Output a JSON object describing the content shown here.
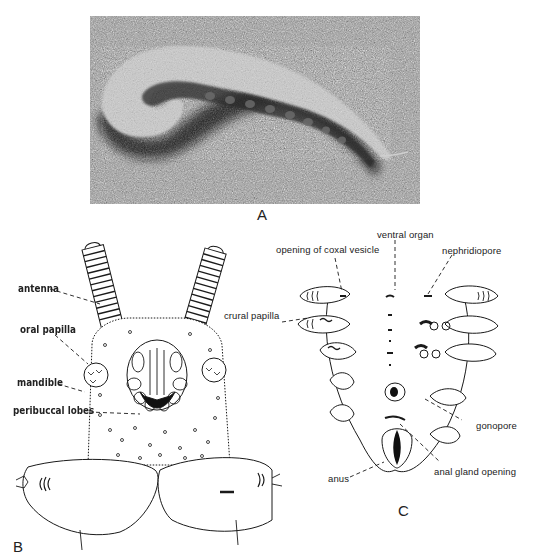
{
  "figure": {
    "top_caption_fragment": "",
    "panels": [
      {
        "id": "A",
        "label": "A",
        "type": "photograph",
        "description": "Onychophoran (velvet worm) curled on a textured substrate"
      },
      {
        "id": "B",
        "label": "B",
        "type": "line-drawing",
        "description": "Ventral view of head region",
        "annotations": [
          {
            "text": "antenna"
          },
          {
            "text": "oral papilla"
          },
          {
            "text": "mandible"
          },
          {
            "text": "peribuccal lobes"
          }
        ]
      },
      {
        "id": "C",
        "label": "C",
        "type": "line-drawing",
        "description": "Ventral view of posterior body region",
        "annotations": [
          {
            "text": "opening of coxal vesicle"
          },
          {
            "text": "ventral organ"
          },
          {
            "text": "nephridiopore"
          },
          {
            "text": "crural papilla"
          },
          {
            "text": "gonopore"
          },
          {
            "text": "anal gland opening"
          },
          {
            "text": "anus"
          }
        ]
      }
    ]
  },
  "colors": {
    "ink": "#1a1a1a",
    "photo_bg": "#8e8e8e",
    "paper": "#ffffff"
  }
}
